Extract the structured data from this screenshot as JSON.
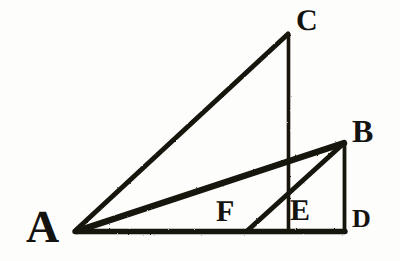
{
  "figure": {
    "type": "line-diagram",
    "canvas": {
      "width": 400,
      "height": 261
    },
    "ink_color": "#15130f",
    "background_color": "#fdfdfc",
    "points": {
      "A": {
        "label": "A",
        "x": 75,
        "y": 231
      },
      "B": {
        "label": "B",
        "x": 344,
        "y": 143
      },
      "C": {
        "label": "C",
        "x": 288,
        "y": 33
      },
      "D": {
        "label": "D",
        "x": 344,
        "y": 231
      },
      "E": {
        "label": "E",
        "x": 288,
        "y": 231
      },
      "F": {
        "label": "F",
        "x": 248,
        "y": 231
      }
    },
    "segments": [
      {
        "name": "base-AD",
        "from": "A",
        "to": "D",
        "stroke_width": 5
      },
      {
        "name": "hypotenuse-AC",
        "from": "A",
        "to": "C",
        "stroke_width": 5
      },
      {
        "name": "altitude-CE",
        "from": "C",
        "to": "E",
        "stroke_width": 4
      },
      {
        "name": "hypotenuse-AB",
        "from": "A",
        "to": "B",
        "stroke_width": 6
      },
      {
        "name": "altitude-BD",
        "from": "B",
        "to": "D",
        "stroke_width": 4
      },
      {
        "name": "cevian-FB",
        "from": "F",
        "to": "B",
        "stroke_width": 5
      }
    ],
    "labels": {
      "A": "A",
      "B": "B",
      "C": "C",
      "D": "D",
      "E": "E",
      "F": "F"
    }
  }
}
